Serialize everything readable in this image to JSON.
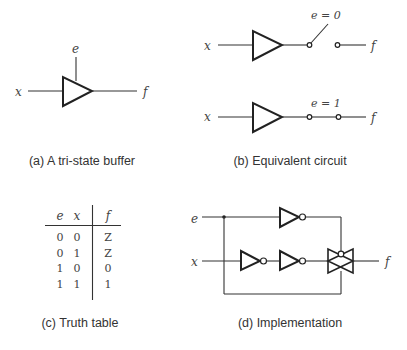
{
  "panels": {
    "a": {
      "caption": "(a) A tri-state buffer",
      "input_label": "x",
      "enable_label": "e",
      "output_label": "f"
    },
    "b": {
      "caption": "(b) Equivalent circuit",
      "top": {
        "input_label": "x",
        "condition_label": "e = 0",
        "output_label": "f",
        "switch_state": "open"
      },
      "bottom": {
        "input_label": "x",
        "condition_label": "e = 1",
        "output_label": "f",
        "switch_state": "closed"
      }
    },
    "c": {
      "caption": "(c) Truth table",
      "headers": [
        "e",
        "x",
        "f"
      ],
      "rows": [
        [
          "0",
          "0",
          "Z"
        ],
        [
          "0",
          "1",
          "Z"
        ],
        [
          "1",
          "0",
          "0"
        ],
        [
          "1",
          "1",
          "1"
        ]
      ]
    },
    "d": {
      "caption": "(d) Implementation",
      "enable_label": "e",
      "input_label": "x",
      "output_label": "f"
    }
  }
}
